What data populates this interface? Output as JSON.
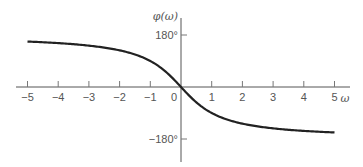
{
  "chart_data": {
    "type": "line",
    "title": "",
    "xlabel": "ω",
    "ylabel": "φ(ω)",
    "xlim": [
      -5,
      5
    ],
    "ylim": [
      -180,
      180
    ],
    "x_ticks": [
      -5,
      -4,
      -3,
      -2,
      -1,
      0,
      1,
      2,
      3,
      4,
      5
    ],
    "x_tick_labels": [
      "−5",
      "−4",
      "−3",
      "−2",
      "−1",
      "0",
      "1",
      "2",
      "3",
      "4",
      "5"
    ],
    "y_ticks": [
      180,
      -180
    ],
    "y_tick_labels": [
      "180°",
      "−180°"
    ],
    "grid": false,
    "legend": null,
    "series": [
      {
        "name": "φ(ω)",
        "x": [
          -5,
          -4,
          -3,
          -2,
          -1,
          -0.5,
          0,
          0.5,
          1,
          2,
          3,
          4,
          5
        ],
        "values": [
          157,
          152,
          143,
          127,
          90,
          53,
          0,
          -53,
          -90,
          -127,
          -143,
          -152,
          -157
        ]
      }
    ]
  }
}
